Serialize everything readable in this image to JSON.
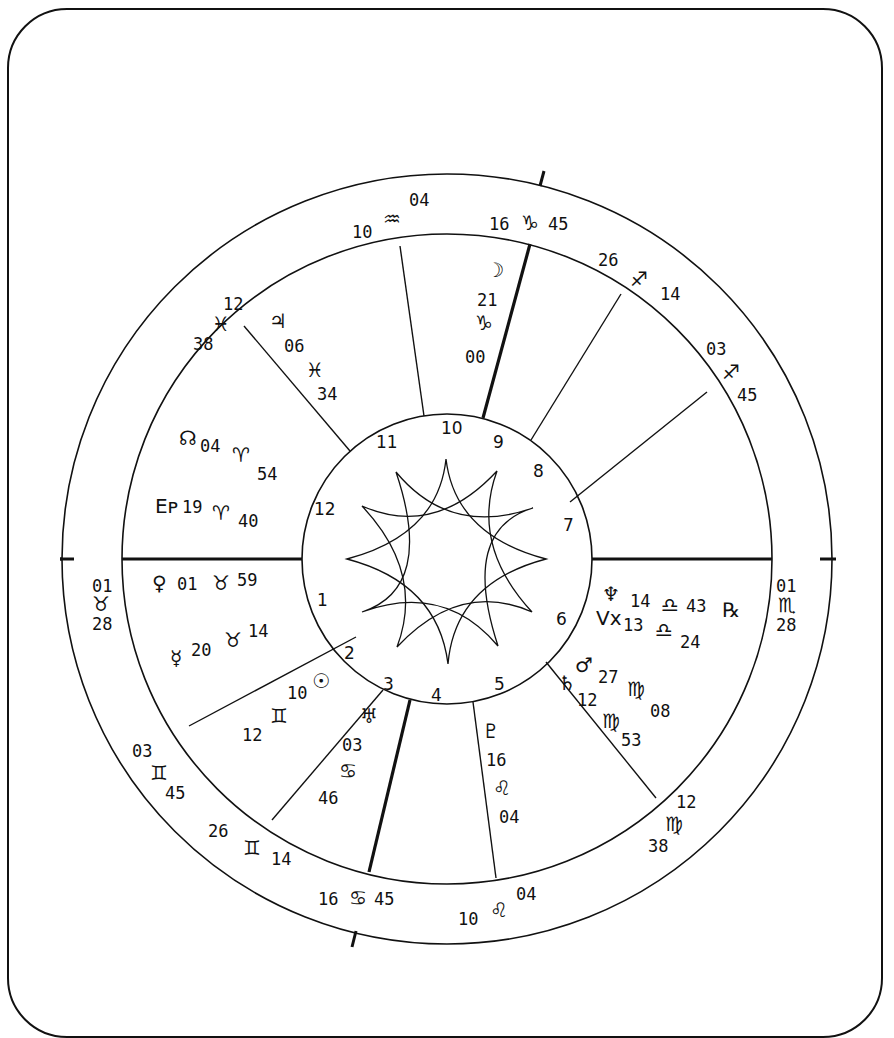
{
  "chart_type": "natal horoscope wheel",
  "colors": {
    "ink": "#111111",
    "paper": "#ffffff"
  },
  "house_numbers": [
    "1",
    "2",
    "3",
    "4",
    "5",
    "6",
    "7",
    "8",
    "9",
    "10",
    "11",
    "12"
  ],
  "cusps": [
    {
      "name": "ascendant",
      "deg": "01",
      "sign": "♉",
      "sign_name": "taurus",
      "min": "28"
    },
    {
      "name": "cusp-2",
      "deg": "03",
      "sign": "♊",
      "sign_name": "gemini",
      "min": "45"
    },
    {
      "name": "cusp-3",
      "deg": "26",
      "sign": "♊",
      "sign_name": "gemini",
      "min": "14"
    },
    {
      "name": "imum-coeli",
      "deg": "16",
      "sign": "♋",
      "sign_name": "cancer",
      "min": "45"
    },
    {
      "name": "cusp-5",
      "deg": "10",
      "sign": "♌",
      "sign_name": "leo",
      "min": "04"
    },
    {
      "name": "cusp-6",
      "deg": "12",
      "sign": "♍",
      "sign_name": "virgo",
      "min": "38"
    },
    {
      "name": "descendant",
      "deg": "01",
      "sign": "♏",
      "sign_name": "scorpio",
      "min": "28"
    },
    {
      "name": "cusp-8",
      "deg": "03",
      "sign": "♐",
      "sign_name": "sagittarius",
      "min": "45"
    },
    {
      "name": "cusp-9",
      "deg": "26",
      "sign": "♐",
      "sign_name": "sagittarius",
      "min": "14"
    },
    {
      "name": "midheaven",
      "deg": "16",
      "sign": "♑",
      "sign_name": "capricorn",
      "min": "45"
    },
    {
      "name": "cusp-11",
      "deg": "10",
      "sign": "♒",
      "sign_name": "aquarius",
      "min": "04"
    },
    {
      "name": "cusp-12",
      "deg": "12",
      "sign": "♓",
      "sign_name": "pisces",
      "min": "38"
    }
  ],
  "planets": [
    {
      "name": "moon",
      "glyph": "☽",
      "deg": "21",
      "sign": "♑",
      "min": "00"
    },
    {
      "name": "jupiter",
      "glyph": "♃",
      "deg": "06",
      "sign": "♓",
      "min": "34"
    },
    {
      "name": "north-node",
      "glyph": "☊",
      "deg": "04",
      "sign": "♈",
      "min": "54"
    },
    {
      "name": "earth-point",
      "glyph": "Eᴘ",
      "deg": "19",
      "sign": "♈",
      "min": "40"
    },
    {
      "name": "venus",
      "glyph": "♀",
      "deg": "01",
      "sign": "♉",
      "min": "59"
    },
    {
      "name": "mercury",
      "glyph": "☿",
      "deg": "20",
      "sign": "♉",
      "min": "14"
    },
    {
      "name": "sun",
      "glyph": "☉",
      "deg": "10",
      "sign": "♊",
      "min": "12"
    },
    {
      "name": "uranus",
      "glyph": "♅",
      "deg": "03",
      "sign": "♋",
      "min": "46"
    },
    {
      "name": "pluto",
      "glyph": "♇",
      "deg": "16",
      "sign": "♌",
      "min": "04"
    },
    {
      "name": "saturn",
      "glyph": "♄",
      "deg": "12",
      "sign": "♍",
      "min": "53"
    },
    {
      "name": "mars",
      "glyph": "♂",
      "deg": "27",
      "sign": "♍",
      "min": "08"
    },
    {
      "name": "vertex",
      "glyph": "Vx",
      "deg": "13",
      "sign": "♎",
      "min": "24"
    },
    {
      "name": "neptune",
      "glyph": "♆",
      "deg": "14",
      "sign": "♎",
      "min": "43",
      "retrograde": "℞"
    }
  ]
}
